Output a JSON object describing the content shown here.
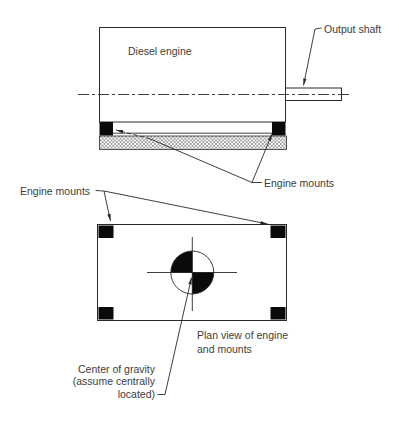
{
  "side_view": {
    "engine_label": "Diesel engine",
    "output_shaft_label": "Output shaft",
    "engine_mounts_label": "Engine mounts"
  },
  "plan_view": {
    "engine_mounts_label": "Engine mounts",
    "caption": {
      "line1": "Plan view of engine",
      "line2": "and mounts"
    },
    "center_of_gravity": {
      "line1": "Center of gravity",
      "line2": "(assume centrally",
      "line3": "located)"
    }
  },
  "colors": {
    "line": "#2a2a2a",
    "text": "#3d3d3d",
    "mount_fill": "#0a0a0a",
    "hatch": "#6b6b6b",
    "background": "#ffffff"
  }
}
